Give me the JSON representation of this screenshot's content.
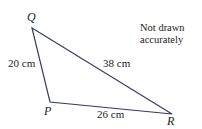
{
  "diagram": {
    "line_color": "#3a3a6a",
    "vertices": [
      {
        "name": "Q",
        "x": 32,
        "y": 28
      },
      {
        "name": "P",
        "x": 50,
        "y": 102
      },
      {
        "name": "R",
        "x": 172,
        "y": 114
      }
    ],
    "sides": [
      {
        "from": "Q",
        "to": "P",
        "label": "20 cm"
      },
      {
        "from": "Q",
        "to": "R",
        "label": "38 cm"
      },
      {
        "from": "P",
        "to": "R",
        "label": "26 cm"
      }
    ],
    "note_line1": "Not drawn",
    "note_line2": "accurately"
  }
}
